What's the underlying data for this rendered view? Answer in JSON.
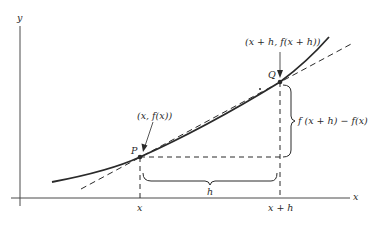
{
  "diagram": {
    "type": "secant-line-difference-quotient",
    "axes": {
      "x_label": "x",
      "y_label": "y"
    },
    "points": {
      "P": {
        "label": "P",
        "coord_label": "(x, f(x))"
      },
      "Q": {
        "label": "Q",
        "coord_label": "(x + h, f(x + h))"
      }
    },
    "tick_labels": {
      "x": "x",
      "x_plus_h": "x + h"
    },
    "brackets": {
      "horizontal": "h",
      "vertical": "f (x + h) − f(x)"
    },
    "colors": {
      "ink": "#2a2a2a",
      "axis": "#4a4a4a",
      "background": "#ffffff"
    }
  }
}
